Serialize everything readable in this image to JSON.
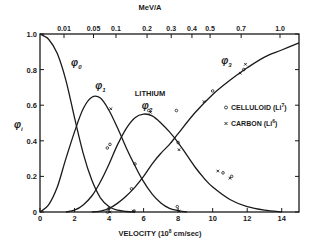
{
  "chart_data": {
    "type": "line",
    "title": "",
    "annotation": "LITHIUM",
    "xlabel": "VELOCITY (10^8 cm/sec)",
    "xlabel_parts": {
      "pre": "VELOCITY (10",
      "sup": "8",
      "post": " cm/sec)"
    },
    "ylabel": "φi",
    "top_axis_label": "MeV/A",
    "xlim": [
      0,
      15
    ],
    "ylim": [
      0,
      1.0
    ],
    "x_ticks": [
      0,
      2,
      4,
      6,
      8,
      10,
      12,
      14
    ],
    "x_tick_labels": [
      "0",
      "2",
      "4",
      "6",
      "8",
      "10",
      "12",
      "14"
    ],
    "y_ticks": [
      0,
      0.2,
      0.4,
      0.6,
      0.8,
      1.0
    ],
    "y_tick_labels": [
      "0",
      "0.2",
      "0.4",
      "0.6",
      "0.8",
      "1.0"
    ],
    "top_ticks": [
      {
        "label": "0.01",
        "x": 1.39
      },
      {
        "label": "0.05",
        "x": 3.1
      },
      {
        "label": "0.1",
        "x": 4.4
      },
      {
        "label": "0.2",
        "x": 6.2
      },
      {
        "label": "0.3",
        "x": 7.6
      },
      {
        "label": "0.4",
        "x": 8.8
      },
      {
        "label": "0.5",
        "x": 9.85
      },
      {
        "label": "0.7",
        "x": 11.65
      },
      {
        "label": "1.0",
        "x": 13.9
      }
    ],
    "grid": false,
    "legend_position": "right-center",
    "series": [
      {
        "name": "φ0",
        "label_pos": [
          1.8,
          0.82
        ],
        "x": [
          0,
          0.5,
          1.0,
          1.5,
          2.0,
          2.5,
          3.0,
          3.5,
          4.0,
          4.5,
          5.0,
          5.5
        ],
        "y": [
          1.0,
          0.97,
          0.89,
          0.74,
          0.53,
          0.33,
          0.18,
          0.08,
          0.03,
          0.01,
          0.003,
          0.0
        ]
      },
      {
        "name": "φ1",
        "label_pos": [
          3.2,
          0.69
        ],
        "x": [
          0,
          0.5,
          1.0,
          1.5,
          2.0,
          2.5,
          3.0,
          3.5,
          4.0,
          4.5,
          5.0,
          5.5,
          6.0,
          6.5,
          7.0,
          7.5,
          8.0,
          8.5
        ],
        "y": [
          0.0,
          0.04,
          0.14,
          0.3,
          0.45,
          0.58,
          0.645,
          0.64,
          0.57,
          0.47,
          0.36,
          0.26,
          0.17,
          0.1,
          0.05,
          0.02,
          0.008,
          0.0
        ]
      },
      {
        "name": "φ2",
        "label_pos": [
          5.9,
          0.58
        ],
        "x": [
          1.5,
          2.0,
          2.5,
          3.0,
          3.5,
          4.0,
          4.5,
          5.0,
          5.5,
          6.0,
          6.5,
          7.0,
          7.5,
          8.0,
          8.5,
          9.0,
          9.5,
          10.0,
          11.0,
          12.0,
          13.0,
          14.0
        ],
        "y": [
          0.0,
          0.01,
          0.04,
          0.09,
          0.17,
          0.27,
          0.38,
          0.47,
          0.53,
          0.55,
          0.54,
          0.5,
          0.45,
          0.39,
          0.32,
          0.25,
          0.19,
          0.14,
          0.07,
          0.03,
          0.01,
          0.0
        ]
      },
      {
        "name": "φ3",
        "label_pos": [
          10.5,
          0.83
        ],
        "x": [
          3.0,
          3.5,
          4.0,
          4.5,
          5.0,
          5.5,
          6.0,
          6.5,
          7.0,
          7.5,
          8.0,
          9.0,
          10.0,
          11.0,
          12.0,
          13.0,
          14.0,
          15.0
        ],
        "y": [
          0.0,
          0.005,
          0.02,
          0.05,
          0.09,
          0.14,
          0.2,
          0.27,
          0.33,
          0.38,
          0.44,
          0.56,
          0.66,
          0.74,
          0.81,
          0.87,
          0.91,
          0.95
        ]
      }
    ],
    "markers": {
      "celluloid": [
        [
          3.9,
          0.36
        ],
        [
          4.05,
          0.38
        ],
        [
          5.5,
          0.27
        ],
        [
          5.3,
          0.13
        ],
        [
          5.45,
          0.005
        ],
        [
          6.3,
          0.57
        ],
        [
          7.9,
          0.57
        ],
        [
          8.0,
          0.39
        ],
        [
          10.0,
          0.68
        ],
        [
          11.8,
          0.8
        ],
        [
          4.0,
          0.02
        ],
        [
          7.95,
          0.03
        ],
        [
          10.6,
          0.22
        ],
        [
          11.1,
          0.2
        ],
        [
          3.9,
          0.0
        ]
      ],
      "carbon": [
        [
          4.1,
          0.58
        ],
        [
          6.4,
          0.56
        ],
        [
          8.05,
          0.35
        ],
        [
          9.5,
          0.62
        ],
        [
          11.6,
          0.78
        ],
        [
          11.9,
          0.83
        ],
        [
          10.3,
          0.23
        ],
        [
          11.0,
          0.19
        ],
        [
          4.05,
          0.0
        ],
        [
          5.4,
          0.005
        ],
        [
          8.05,
          0.005
        ]
      ]
    },
    "legend": [
      {
        "symbol": "circle",
        "text": "CELLULOID",
        "isotope": "(Li",
        "sup": "7",
        "close": ")"
      },
      {
        "symbol": "x",
        "text": "CARBON",
        "isotope": "(Li",
        "sup": "6",
        "close": ")"
      }
    ]
  }
}
